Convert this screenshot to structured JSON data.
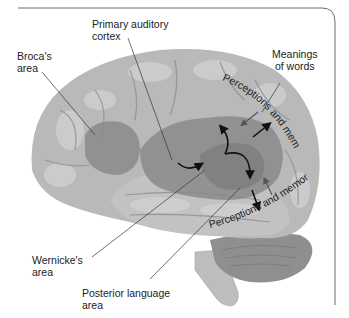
{
  "figure": {
    "type": "labeled anatomical diagram",
    "colors": {
      "background": "#ffffff",
      "frame": "#6d6d6d",
      "cortex": "#b9b9b9",
      "cortex_highlight": "#d6d6d6",
      "sulci": "#8e8e8e",
      "language_region": "#8a8a8a",
      "cerebellum": "#8f8f8f",
      "brainstem": "#bdbdbd",
      "text": "#222222",
      "leader_line": "#333333",
      "arrow": "#111111"
    }
  },
  "labels": {
    "brocas_area": "Broca's\narea",
    "primary_auditory_cortex": "Primary auditory\ncortex",
    "meanings_of_words": "Meanings\nof words",
    "wernickes_area": "Wernicke's\narea",
    "posterior_language_area": "Posterior language\narea"
  },
  "curved_labels": {
    "upper": "Perceptions and memories",
    "lower": "Perceptions and memories"
  }
}
